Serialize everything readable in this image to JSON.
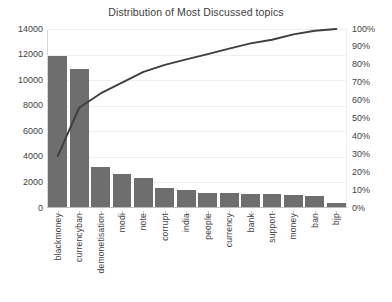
{
  "chart_data": {
    "type": "bar",
    "title": "Distribution of Most Discussed topics",
    "xlabel": "",
    "ylabel": "",
    "grid": true,
    "legend": "none",
    "categories": [
      "blackmoney",
      "currencyban",
      "demonetisation",
      "modi",
      "note",
      "corrupt",
      "india",
      "people",
      "currency",
      "bank",
      "support",
      "money",
      "ban",
      "bjp"
    ],
    "series": [
      {
        "name": "Frequency",
        "type": "bar",
        "axis": "left",
        "values": [
          11900,
          10850,
          3200,
          2650,
          2380,
          1570,
          1440,
          1200,
          1140,
          1080,
          1080,
          1030,
          930,
          390
        ]
      },
      {
        "name": "Cumulative Percentage",
        "type": "line",
        "axis": "right",
        "values": [
          29,
          56,
          64,
          70,
          76,
          80,
          83,
          86,
          89,
          92,
          94,
          97,
          99,
          100
        ]
      }
    ],
    "ylim": [
      0,
      14000
    ],
    "y2lim": [
      0,
      100
    ],
    "yticks": [
      0,
      2000,
      4000,
      6000,
      8000,
      10000,
      12000,
      14000
    ],
    "ytick_labels": [
      "0",
      "2000",
      "4000",
      "6000",
      "8000",
      "10000",
      "12000",
      "14000"
    ],
    "y2ticks": [
      0,
      10,
      20,
      30,
      40,
      50,
      60,
      70,
      80,
      90,
      100
    ],
    "y2tick_labels": [
      "0%",
      "10%",
      "20%",
      "30%",
      "40%",
      "50%",
      "60%",
      "70%",
      "80%",
      "90%",
      "100%"
    ],
    "colors": {
      "bar": "#6e6e6e",
      "line": "#3f3f3f",
      "grid": "#f0f0f0",
      "axis": "#bdbdbd",
      "text": "#3f3f3f",
      "background": "#ffffff"
    }
  }
}
